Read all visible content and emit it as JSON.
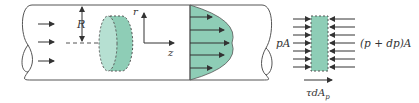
{
  "diagram": {
    "title": "",
    "colors": {
      "fill": "#8ecdb6",
      "fill_light": "#b6e0d2",
      "stroke": "#555555",
      "arrow": "#333333"
    },
    "pipe": {
      "labels": {
        "radius": "R",
        "r_axis": "r",
        "z_axis": "z"
      }
    },
    "free_body": {
      "left_force": "pA",
      "right_force": "(p + dp)A",
      "shear_force": "τdA",
      "shear_subscript": "p"
    }
  }
}
